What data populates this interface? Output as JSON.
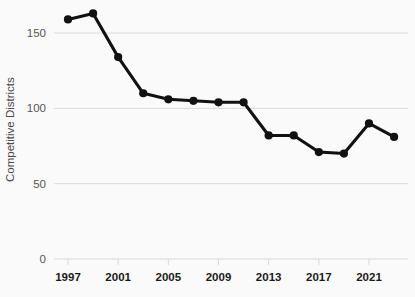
{
  "chart_data": {
    "type": "line",
    "title": "",
    "xlabel": "",
    "ylabel": "Competitive Districts",
    "xlim": [
      1996,
      2024
    ],
    "ylim": [
      0,
      172
    ],
    "grid": true,
    "legend": false,
    "x_ticks": [
      "1997",
      "2001",
      "2005",
      "2009",
      "2013",
      "2017",
      "2021"
    ],
    "x_tick_values": [
      1997,
      2001,
      2005,
      2009,
      2013,
      2017,
      2021
    ],
    "y_ticks": [
      "0",
      "50",
      "100",
      "150"
    ],
    "y_tick_values": [
      0,
      50,
      100,
      150
    ],
    "x": [
      1997,
      1999,
      2001,
      2003,
      2005,
      2007,
      2009,
      2011,
      2013,
      2015,
      2017,
      2019,
      2021,
      2023
    ],
    "values": [
      159,
      163,
      134,
      110,
      106,
      105,
      104,
      104,
      82,
      82,
      71,
      70,
      90,
      81
    ],
    "series": [
      {
        "name": "Competitive Districts",
        "x": [
          1997,
          1999,
          2001,
          2003,
          2005,
          2007,
          2009,
          2011,
          2013,
          2015,
          2017,
          2019,
          2021,
          2023
        ],
        "values": [
          159,
          163,
          134,
          110,
          106,
          105,
          104,
          104,
          82,
          82,
          71,
          70,
          90,
          81
        ]
      }
    ]
  },
  "style": {
    "background": "#fafafa",
    "line_color": "#111111",
    "marker_color": "#111111",
    "grid_color": "#d8d8d8",
    "axis_text_color": "#1a1a1a",
    "ylabel_color": "#4a4a4a"
  }
}
